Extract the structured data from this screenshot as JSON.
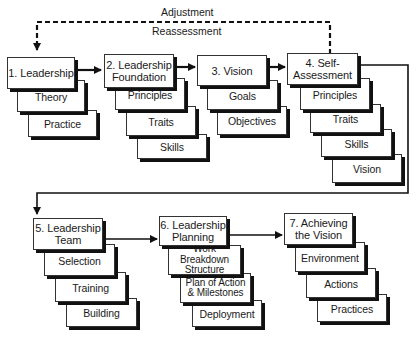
{
  "diagram": {
    "feedback": {
      "top_label": "Adjustment",
      "bottom_label": "Reassessment"
    },
    "stages": [
      {
        "title": "1. Leadership",
        "items": [
          "Theory",
          "Practice"
        ]
      },
      {
        "title": "2. Leadership Foundation",
        "items": [
          "Principles",
          "Traits",
          "Skills"
        ]
      },
      {
        "title": "3. Vision",
        "items": [
          "Goals",
          "Objectives"
        ]
      },
      {
        "title": "4. Self-Assessment",
        "items": [
          "Principles",
          "Traits",
          "Skills",
          "Vision"
        ]
      },
      {
        "title": "5. Leadership Team",
        "items": [
          "Selection",
          "Training",
          "Building"
        ]
      },
      {
        "title": "6. Leadership Planning",
        "items": [
          "Work Breakdown Structure",
          "Plan of Action & Milestones",
          "Deployment"
        ]
      },
      {
        "title": "7. Achieving the Vision",
        "items": [
          "Environment",
          "Actions",
          "Practices"
        ]
      }
    ],
    "flow": [
      "1→2",
      "2→3",
      "3→4",
      "4→5",
      "5→6",
      "6→7",
      "4⇢1 (dashed feedback)"
    ],
    "colors": {
      "line": "#111111",
      "box_border": "#333333",
      "shadow": "#111111",
      "background": "#ffffff"
    }
  },
  "s1": {
    "title": "1. Leadership",
    "i0": "Theory",
    "i1": "Practice"
  },
  "s2": {
    "l1": "2. Leadership",
    "l2": "Foundation",
    "i0": "Principles",
    "i1": "Traits",
    "i2": "Skills"
  },
  "s3": {
    "title": "3. Vision",
    "i0": "Goals",
    "i1": "Objectives"
  },
  "s4": {
    "l1": "4. Self-",
    "l2": "Assessment",
    "i0": "Principles",
    "i1": "Traits",
    "i2": "Skills",
    "i3": "Vision"
  },
  "s5": {
    "l1": "5. Leadership",
    "l2": "Team",
    "i0": "Selection",
    "i1": "Training",
    "i2": "Building"
  },
  "s6": {
    "l1": "6. Leadership",
    "l2": "Planning",
    "i0a": "Work Breakdown",
    "i0b": "Structure",
    "i1a": "Plan of Action",
    "i1b": "& Milestones",
    "i2": "Deployment"
  },
  "s7": {
    "l1": "7. Achieving",
    "l2": "the Vision",
    "i0": "Environment",
    "i1": "Actions",
    "i2": "Practices"
  },
  "fb": {
    "top": "Adjustment",
    "bottom": "Reassessment"
  }
}
